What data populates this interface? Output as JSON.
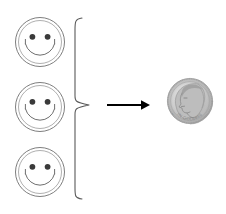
{
  "figure": {
    "title": "Three smiley faces equal one dime",
    "background_color": "#ffffff",
    "width": 226,
    "height": 214,
    "relation": "equivalence",
    "left_group_count": 3,
    "right_group_count": 1
  },
  "smileys": {
    "count": 3,
    "label": "smiley face",
    "outline_color": "#6b6b6b",
    "eye_color": "#3a3a3a",
    "fill_color": "#ffffff",
    "items": [
      {
        "label": "smiley face 1",
        "cx": 40,
        "cy": 42,
        "r": 25
      },
      {
        "label": "smiley face 2",
        "cx": 40,
        "cy": 107,
        "r": 25
      },
      {
        "label": "smiley face 3",
        "cx": 40,
        "cy": 172,
        "r": 25
      }
    ]
  },
  "brace": {
    "label": "curly brace grouping three smiley faces",
    "color": "#5a5a5a",
    "top": 18,
    "bottom": 199,
    "tip_x": 89,
    "spine_x": 75
  },
  "arrow": {
    "label": "rightward arrow",
    "color": "#000000",
    "x_start": 107,
    "x_end": 149,
    "y": 105
  },
  "coin": {
    "label": "US dime",
    "denomination": "dime",
    "value_cents": 10,
    "obverse_text": "LIBERTY",
    "portrait": "Roosevelt profile facing left",
    "cx": 190,
    "cy": 101,
    "r": 23,
    "rim_color": "#9a9a9a",
    "face_color": "#c9c9c9",
    "detail_color": "#8a8a8a",
    "shadow_color": "#b4b4b4"
  }
}
